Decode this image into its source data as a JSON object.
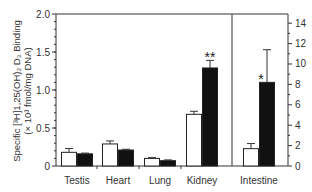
{
  "chart_data": {
    "type": "bar",
    "title": "",
    "ylabel_line1": "Specific [³H]1,25(OH)₂ D₃ Binding",
    "ylabel_line2": "(× 10³ fmol/mg DNA)",
    "xlabel": "",
    "categories": [
      "Testis",
      "Heart",
      "Lung",
      "Kidney",
      "Intestine"
    ],
    "left_axis": {
      "ylim": [
        0,
        2.0
      ],
      "ticks": [
        0,
        0.5,
        1.0,
        1.5,
        2.0
      ],
      "tick_labels": [
        "0",
        "0.5",
        "1.0",
        "1.5",
        "2.0"
      ],
      "applies_to": [
        "Testis",
        "Heart",
        "Lung",
        "Kidney"
      ]
    },
    "right_axis": {
      "ylim": [
        0,
        14.9
      ],
      "ticks": [
        0,
        2,
        4,
        6,
        8,
        10,
        12,
        14
      ],
      "tick_labels": [
        "0",
        "2",
        "4",
        "6",
        "8",
        "10",
        "12",
        "14"
      ],
      "applies_to": [
        "Intestine"
      ]
    },
    "series": [
      {
        "name": "control",
        "fill": "#ffffff",
        "values": [
          0.18,
          0.29,
          0.1,
          0.68,
          1.7
        ],
        "errors": [
          0.05,
          0.04,
          0.01,
          0.04,
          0.5
        ]
      },
      {
        "name": "treated",
        "fill": "#111111",
        "values": [
          0.16,
          0.21,
          0.07,
          1.29,
          8.2
        ],
        "errors": [
          0.01,
          0.01,
          0.01,
          0.1,
          3.2
        ]
      }
    ],
    "annotations": [
      {
        "category": "Kidney",
        "series": "treated",
        "text": "**"
      },
      {
        "category": "Intestine",
        "series": "treated",
        "text": "*"
      }
    ],
    "grid": false,
    "legend": "none"
  }
}
